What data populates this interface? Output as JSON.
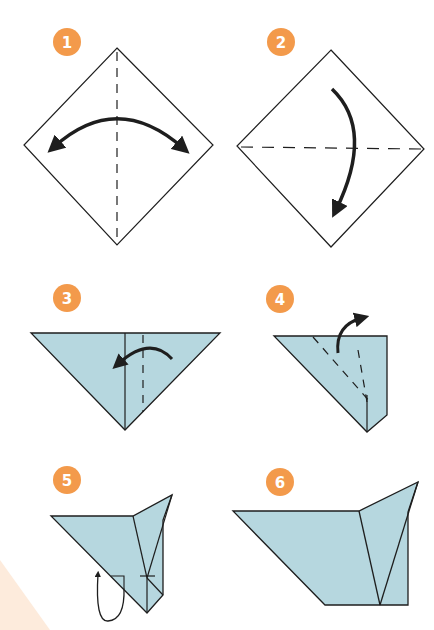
{
  "colors": {
    "badge": "#f39a4b",
    "paper_fill": "#b6d7df",
    "stroke": "#1e1e1e",
    "background": "#ffffff",
    "corner_tint": "#fdebdc"
  },
  "steps": [
    {
      "number": "1",
      "action": "valley fold in half vertically, then unfold",
      "fold_line": "vertical-dashed",
      "arrow": "double-headed-arc"
    },
    {
      "number": "2",
      "action": "fold top corner down to bottom along horizontal diagonal",
      "fold_line": "horizontal-dashed",
      "arrow": "curved-down"
    },
    {
      "number": "3",
      "action": "fold right side toward center",
      "fold_line": "vertical-dashed",
      "arrow": "curved-left"
    },
    {
      "number": "4",
      "action": "fold flap up and outward",
      "fold_line": "diagonal-dashed",
      "arrow": "curved-up-right"
    },
    {
      "number": "5",
      "action": "fold bottom flap behind",
      "arrow": "loop-back"
    },
    {
      "number": "6",
      "action": "result",
      "arrow": "none"
    }
  ]
}
